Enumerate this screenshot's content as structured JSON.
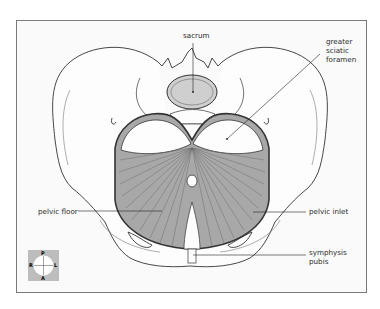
{
  "diagram": {
    "labels": {
      "sacrum": "sacrum",
      "greater_sciatic_foramen": [
        "greater",
        "sciatic",
        "foramen"
      ],
      "pelvic_floor": "pelvic floor",
      "pelvic_inlet": "pelvic inlet",
      "symphysis_pubis": [
        "symphysis",
        "pubis"
      ]
    },
    "compass": {
      "top": "P",
      "bottom": "A",
      "left": "R",
      "right": "L"
    },
    "colors": {
      "frame_border": "#7a7a7a",
      "background": "#fafafa",
      "muscle_fill": "#a8a8a8",
      "muscle_lines": "#6e6e6e",
      "bone_outline": "#333333",
      "sacrum_fill": "#cfcfcf",
      "compass_bg": "#bdbdbd"
    }
  }
}
